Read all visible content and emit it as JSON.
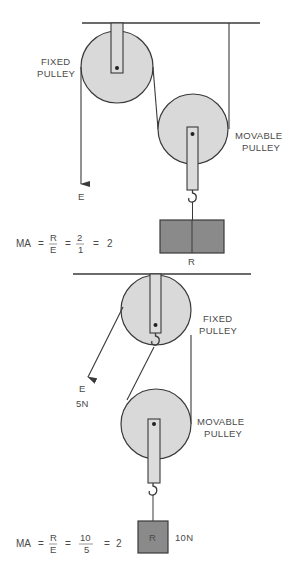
{
  "colors": {
    "line": "#3a3a3a",
    "pulley_fill": "#d9d9d9",
    "strap_fill": "#dcdcdc",
    "weight_fill": "#8a8a8a",
    "text": "#4a4a4a"
  },
  "diagram_top": {
    "fixed_pulley_label": [
      "FIXED",
      "PULLEY"
    ],
    "movable_pulley_label": [
      "MOVABLE",
      "PULLEY"
    ],
    "effort_label": "E",
    "load_label": "R",
    "equation": {
      "lhs": "MA",
      "eq1": "=",
      "frac1_num": "R",
      "frac1_den": "E",
      "eq2": "=",
      "frac2_num": "2",
      "frac2_den": "1",
      "eq3": "=",
      "result": "2"
    }
  },
  "diagram_bottom": {
    "fixed_pulley_label": [
      "FIXED",
      "PULLEY"
    ],
    "movable_pulley_label": [
      "MOVABLE",
      "PULLEY"
    ],
    "effort_label": "E",
    "effort_value": "5N",
    "load_label": "R",
    "load_value": "10N",
    "equation": {
      "lhs": "MA",
      "eq1": "=",
      "frac1_num": "R",
      "frac1_den": "E",
      "eq2": "=",
      "frac2_num": "10",
      "frac2_den": "5",
      "eq3": "=",
      "result": "2"
    }
  }
}
